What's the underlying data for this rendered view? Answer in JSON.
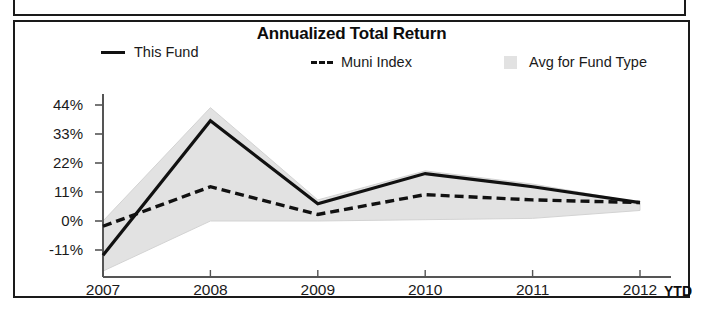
{
  "chart_data": {
    "type": "line",
    "title": "Annualized Total Return",
    "xlabel": "",
    "ylabel": "",
    "categories": [
      "2007",
      "2008",
      "2009",
      "2010",
      "2011",
      "2012"
    ],
    "x_axis_suffix": "YTD",
    "ytick_labels": [
      "44%",
      "33%",
      "22%",
      "11%",
      "0%",
      "-11%"
    ],
    "ytick_values": [
      44,
      33,
      22,
      11,
      0,
      -11
    ],
    "ylim": [
      -20,
      47
    ],
    "grid": false,
    "legend_position": "top",
    "series": [
      {
        "name": "This Fund",
        "style": "solid",
        "color": "#111111",
        "values": [
          -13,
          38,
          6.5,
          18,
          13,
          7
        ]
      },
      {
        "name": "Muni Index",
        "style": "dashed",
        "color": "#111111",
        "values": [
          -2,
          13,
          2.5,
          10,
          8,
          7
        ]
      },
      {
        "name": "Avg for Fund Type",
        "style": "area-band",
        "color": "#e2e2e2",
        "upper_values": [
          0,
          43,
          8,
          19,
          14,
          7
        ],
        "lower_values": [
          -19,
          0,
          0,
          0.5,
          1,
          4
        ]
      }
    ]
  },
  "chart": {
    "title": "Annualized Total Return",
    "legend": [
      {
        "label": "This Fund",
        "marker": "solid-line-swatch"
      },
      {
        "label": "Muni Index",
        "marker": "dashed-line-swatch"
      },
      {
        "label": "Avg for Fund Type",
        "marker": "area-swatch"
      }
    ],
    "y_ticks": [
      {
        "label": "44%"
      },
      {
        "label": "33%"
      },
      {
        "label": "22%"
      },
      {
        "label": "11%"
      },
      {
        "label": "0%"
      },
      {
        "label": "-11%"
      }
    ],
    "x_ticks": [
      {
        "label": "2007"
      },
      {
        "label": "2008"
      },
      {
        "label": "2009"
      },
      {
        "label": "2010"
      },
      {
        "label": "2011"
      },
      {
        "label": "2012"
      }
    ],
    "x_axis_note": "YTD"
  },
  "colors": {
    "line": "#111111",
    "area": "#e2e2e2",
    "axis": "#555555",
    "border": "#1a1a1a",
    "text": "#1a1a1a"
  }
}
